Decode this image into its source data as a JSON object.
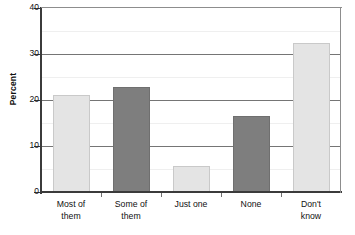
{
  "chart_data": {
    "type": "bar",
    "title": "",
    "subtitle": "",
    "xlabel": "",
    "ylabel": "Percent",
    "categories": [
      "Most of them",
      "Some of them",
      "Just one",
      "None",
      "Don't know"
    ],
    "category_lines": [
      [
        "Most of",
        "them"
      ],
      [
        "Some of",
        "them"
      ],
      [
        "Just one",
        ""
      ],
      [
        "None",
        ""
      ],
      [
        "Don't",
        "know"
      ]
    ],
    "values": [
      21.0,
      22.8,
      5.7,
      16.5,
      32.4
    ],
    "bar_colors": [
      "#e4e4e4",
      "#7e7e7e",
      "#e4e4e4",
      "#7e7e7e",
      "#e4e4e4"
    ],
    "bar_edge_colors": [
      "#c9c9c9",
      "#6f6f6f",
      "#c9c9c9",
      "#6f6f6f",
      "#c9c9c9"
    ],
    "ylim": [
      0,
      40
    ],
    "ytick_labels": [
      "0",
      "10",
      "20",
      "30",
      "40"
    ],
    "ytick_values": [
      0,
      10,
      20,
      30,
      40
    ],
    "minor_gridline_values": [
      5,
      15,
      25,
      35
    ],
    "grid": true,
    "legend": "none"
  },
  "axis": {
    "y_title": "Percent",
    "y_ticks": [
      {
        "label": "40",
        "value": 40
      },
      {
        "label": "30",
        "value": 30
      },
      {
        "label": "20",
        "value": 20
      },
      {
        "label": "10",
        "value": 10
      },
      {
        "label": "0",
        "value": 0
      }
    ]
  },
  "bars": [
    {
      "label_line1": "Most of",
      "label_line2": "them",
      "value": 21.0
    },
    {
      "label_line1": "Some of",
      "label_line2": "them",
      "value": 22.8
    },
    {
      "label_line1": "Just one",
      "label_line2": "",
      "value": 5.7
    },
    {
      "label_line1": "None",
      "label_line2": "",
      "value": 16.5
    },
    {
      "label_line1": "Don't",
      "label_line2": "know",
      "value": 32.4
    }
  ]
}
